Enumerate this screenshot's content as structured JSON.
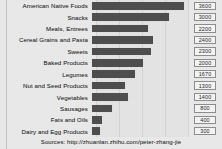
{
  "chart_data": {
    "type": "bar",
    "orientation": "horizontal",
    "title": "",
    "xlabel": "",
    "ylabel": "",
    "grid": true,
    "legend": "none",
    "xlim": [
      0,
      3600
    ],
    "gridlines": [
      0,
      900,
      1800,
      2700,
      3600
    ],
    "categories": [
      "American  Native Foods",
      "Snacks",
      "Meals, Entrees",
      "Cereal Grains and Pasta",
      "Sweets",
      "Baked Products",
      "Legumes",
      "Nut and Seed Products",
      "Vegetables",
      "Sausages",
      "Fats and Oils",
      "Dairy and Egg Products"
    ],
    "values": [
      3600,
      3000,
      2200,
      2400,
      2300,
      2000,
      1670,
      1300,
      1400,
      800,
      400,
      300
    ],
    "value_labels": [
      "3600",
      "3000",
      "2200",
      "2400",
      "2300",
      "2000",
      "1670",
      "1300",
      "1400",
      "800",
      "400",
      "300"
    ],
    "colors": {
      "bar": "#4d4d4d",
      "background": "#e9e9e9",
      "plot_background": "#e4e4e4",
      "gridline": "#d3d3d3",
      "label_text": "#2b2b2b",
      "value_box_fill": "#f4f4f4",
      "value_box_border": "#8d8d8d"
    }
  },
  "footer": {
    "source_text": "Sources:  http://zhuanlan.zhihu.com/peter-zhang-jie"
  }
}
